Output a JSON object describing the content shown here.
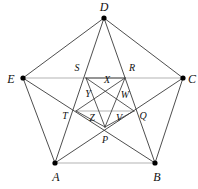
{
  "figure": {
    "type": "geometry-diagram",
    "width": 198,
    "height": 189,
    "background_color": "#ffffff",
    "stroke_color": "#3a3a3a",
    "stroke_color_light": "#b4b4b4",
    "vertex_color": "#000000",
    "label_color": "#111111"
  },
  "outer_vertices": [
    {
      "label": "D",
      "name": "vertex-d",
      "px": 104,
      "py": 18,
      "lx": 104,
      "ly": 7,
      "dot": true
    },
    {
      "label": "C",
      "name": "vertex-c",
      "px": 183,
      "py": 78,
      "lx": 192,
      "ly": 79,
      "dot": true
    },
    {
      "label": "B",
      "name": "vertex-b",
      "px": 155,
      "py": 163,
      "lx": 157,
      "ly": 177,
      "dot": true
    },
    {
      "label": "A",
      "name": "vertex-a",
      "px": 55,
      "py": 163,
      "lx": 56,
      "ly": 177,
      "dot": true
    },
    {
      "label": "E",
      "name": "vertex-e",
      "px": 23,
      "py": 78,
      "lx": 11,
      "ly": 79,
      "dot": true
    }
  ],
  "star_points": [
    {
      "label": "R",
      "name": "point-r",
      "px": 125,
      "py": 78,
      "lx": 132,
      "ly": 68
    },
    {
      "label": "Q",
      "name": "point-q",
      "px": 134,
      "py": 111,
      "lx": 143,
      "ly": 116
    },
    {
      "label": "P",
      "name": "point-p",
      "px": 105,
      "py": 127,
      "lx": 105,
      "ly": 140
    },
    {
      "label": "T",
      "name": "point-t",
      "px": 76,
      "py": 111,
      "lx": 65,
      "ly": 116
    },
    {
      "label": "S",
      "name": "point-s",
      "px": 86,
      "py": 78,
      "lx": 77,
      "ly": 68
    }
  ],
  "inner_pentagon_vertices": [
    {
      "label": "X",
      "name": "point-x",
      "px": 105,
      "py": 88,
      "lx": 107,
      "ly": 80
    },
    {
      "label": "W",
      "name": "point-w",
      "px": 119,
      "py": 98,
      "lx": 125,
      "ly": 95
    },
    {
      "label": "V",
      "name": "point-v",
      "px": 114,
      "py": 114,
      "lx": 119,
      "ly": 118
    },
    {
      "label": "Z",
      "name": "point-z",
      "px": 96,
      "py": 114,
      "lx": 92,
      "ly": 118
    },
    {
      "label": "Y",
      "name": "point-y",
      "px": 91,
      "py": 98,
      "lx": 88,
      "ly": 94
    }
  ],
  "edges": [
    {
      "name": "edge-d-c",
      "from": "D",
      "to": "C",
      "shade": "dark"
    },
    {
      "name": "edge-c-b",
      "from": "C",
      "to": "B",
      "shade": "dark"
    },
    {
      "name": "edge-b-a",
      "from": "B",
      "to": "A",
      "shade": "light"
    },
    {
      "name": "edge-a-e",
      "from": "A",
      "to": "E",
      "shade": "dark"
    },
    {
      "name": "edge-e-d",
      "from": "E",
      "to": "D",
      "shade": "dark"
    }
  ],
  "diagonals": [
    {
      "name": "diagonal-a-c",
      "from": "A",
      "to": "C",
      "shade": "dark"
    },
    {
      "name": "diagonal-a-d",
      "from": "A",
      "to": "D",
      "shade": "dark"
    },
    {
      "name": "diagonal-b-d",
      "from": "B",
      "to": "D",
      "shade": "dark"
    },
    {
      "name": "diagonal-b-e",
      "from": "B",
      "to": "E",
      "shade": "dark"
    },
    {
      "name": "diagonal-c-e",
      "from": "C",
      "to": "E",
      "shade": "light"
    }
  ],
  "inner_star_lines": [
    {
      "name": "inner-line-s-q",
      "from": "S",
      "to": "Q",
      "shade": "dark"
    },
    {
      "name": "inner-line-q-s",
      "from": "R",
      "to": "T",
      "shade": "dark"
    },
    {
      "name": "inner-line-t-r",
      "from": "T",
      "to": "Q",
      "shade": "light"
    },
    {
      "name": "inner-line-p-r",
      "from": "P",
      "to": "R",
      "shade": "dark"
    },
    {
      "name": "inner-line-p-s",
      "from": "P",
      "to": "S",
      "shade": "dark"
    }
  ]
}
